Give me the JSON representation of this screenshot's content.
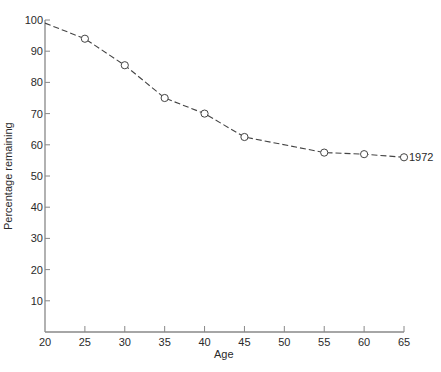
{
  "chart_data": {
    "type": "line",
    "title": "",
    "xlabel": "Age",
    "ylabel": "Percentage remaining",
    "x": [
      20,
      25,
      30,
      35,
      40,
      45,
      55,
      60,
      65
    ],
    "series": [
      {
        "name": "1972",
        "values": [
          99,
          94,
          85.5,
          75,
          70,
          62.5,
          57.5,
          57,
          56
        ],
        "markers": [
          false,
          true,
          true,
          true,
          true,
          true,
          true,
          true,
          true
        ],
        "style": "dashed",
        "end_label": "1972"
      }
    ],
    "xticks": [
      20,
      25,
      30,
      35,
      40,
      45,
      50,
      55,
      60,
      65
    ],
    "yticks": [
      10,
      20,
      30,
      40,
      50,
      60,
      70,
      80,
      90,
      100
    ],
    "xlim": [
      20,
      65
    ],
    "ylim": [
      0,
      100
    ],
    "grid": false,
    "legend": "none (series labelled at line end)"
  },
  "colors": {
    "line": "#444444",
    "axis": "#888888",
    "text": "#2a2a2a"
  }
}
